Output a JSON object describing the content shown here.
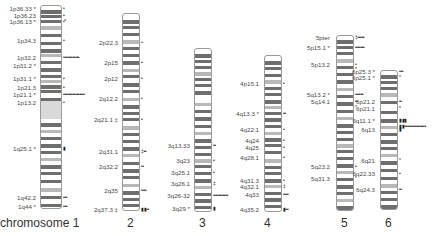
{
  "figure": {
    "type": "chromosome ideogram",
    "chromosomes": [
      {
        "name": "chromosome 1",
        "box": {
          "x": 40,
          "y": 5,
          "w": 22,
          "h": 204
        },
        "bands": [
          4,
          9,
          14,
          20,
          28,
          36,
          43,
          48,
          55,
          62,
          69,
          74,
          79,
          84,
          92,
          98,
          104,
          110,
          117,
          124,
          131,
          138,
          145,
          152,
          159,
          166,
          174,
          182,
          190,
          198
        ],
        "centromere": {
          "y1": 100,
          "y2": 118
        },
        "labels": [
          {
            "text": "1p36.33",
            "y": 8,
            "mark": "*",
            "dots": "•"
          },
          {
            "text": "1p36.23",
            "y": 15,
            "mark": "",
            "dots": "•"
          },
          {
            "text": "1p36.13",
            "y": 21,
            "mark": "*",
            "dots": "•*"
          },
          {
            "text": "1p34.3",
            "y": 40,
            "mark": "",
            "dots": "•"
          },
          {
            "text": "1p32.2",
            "y": 57,
            "mark": "",
            "dots": "••••••••••••"
          },
          {
            "text": "1p31.2",
            "y": 65,
            "mark": "*",
            "dots": ""
          },
          {
            "text": "1p31.1",
            "y": 78,
            "mark": "*",
            "dots": "•"
          },
          {
            "text": "1p21.3",
            "y": 87,
            "mark": "",
            "dots": "•"
          },
          {
            "text": "1p21.1",
            "y": 94,
            "mark": "*",
            "dots": "••••••••••••••••"
          },
          {
            "text": "1p13.2",
            "y": 102,
            "mark": "",
            "dots": "•"
          },
          {
            "text": "1q25.1",
            "y": 148,
            "mark": "*",
            "dots": "▮"
          },
          {
            "text": "1q42.2",
            "y": 197,
            "mark": "",
            "dots": "•••"
          },
          {
            "text": "1q44",
            "y": 206,
            "mark": "*",
            "dots": "•••"
          }
        ],
        "label_x": 36,
        "caption": "chromosome 1",
        "caption_x": 0
      },
      {
        "name": "2",
        "box": {
          "x": 122,
          "y": 13,
          "w": 18,
          "h": 198
        },
        "bands": [
          6,
          12,
          19,
          26,
          33,
          40,
          47,
          55,
          61,
          69,
          76,
          84,
          91,
          98,
          104,
          112,
          119,
          126,
          133,
          140,
          148,
          155,
          162,
          170,
          177,
          184,
          190
        ],
        "labels": [
          {
            "text": "2p22.3",
            "y": 42,
            "mark": "",
            "dots": "•"
          },
          {
            "text": "2p15",
            "y": 62,
            "mark": "",
            "dots": "•"
          },
          {
            "text": "2p12",
            "y": 78,
            "mark": "",
            "dots": "•"
          },
          {
            "text": "2q12.2",
            "y": 98,
            "mark": "",
            "dots": "•"
          },
          {
            "text": "2q21.1",
            "y": 119,
            "mark": "‡",
            "dots": "•"
          },
          {
            "text": "2q31.1",
            "y": 151,
            "mark": "",
            "dots": "‡••"
          },
          {
            "text": "2q32.2",
            "y": 166,
            "mark": "",
            "dots": "••"
          },
          {
            "text": "2q35",
            "y": 190,
            "mark": "",
            "dots": "••••"
          },
          {
            "text": "2q37.3",
            "y": 209,
            "mark": "‡",
            "dots": "▮▮••"
          }
        ],
        "label_x": 118,
        "caption": "2",
        "caption_x": 127
      },
      {
        "name": "3",
        "box": {
          "x": 194,
          "y": 48,
          "w": 18,
          "h": 164
        },
        "bands": [
          5,
          11,
          17,
          23,
          29,
          35,
          42,
          54,
          61,
          68,
          76,
          83,
          90,
          97,
          104,
          110,
          116,
          123,
          130,
          137,
          144,
          150,
          157
        ],
        "labels": [
          {
            "text": "3q13.33",
            "y": 145,
            "mark": "",
            "dots": "••"
          },
          {
            "text": "3q23",
            "y": 160,
            "mark": "",
            "dots": "•"
          },
          {
            "text": "3q25.1",
            "y": 172,
            "mark": "",
            "dots": "•"
          },
          {
            "text": "3q26.1",
            "y": 183,
            "mark": "",
            "dots": "‡"
          },
          {
            "text": "3q26-32",
            "y": 195,
            "mark": "",
            "dots": "•••••••••••"
          },
          {
            "text": "3q29",
            "y": 208,
            "mark": "*",
            "dots": "▮"
          }
        ],
        "label_x": 190,
        "caption": "3",
        "caption_x": 199
      },
      {
        "name": "4",
        "box": {
          "x": 264,
          "y": 55,
          "w": 18,
          "h": 157
        },
        "bands": [
          5,
          11,
          18,
          24,
          31,
          37,
          44,
          50,
          56,
          62,
          69,
          76,
          82,
          88,
          95,
          103,
          110,
          116,
          123,
          129,
          136,
          142,
          149
        ],
        "labels": [
          {
            "text": "4p15.1",
            "y": 83,
            "mark": "",
            "dots": "•"
          },
          {
            "text": "4q13.3",
            "y": 113,
            "mark": "*",
            "dots": "••"
          },
          {
            "text": "4q22.1",
            "y": 129,
            "mark": "",
            "dots": "•"
          },
          {
            "text": "4q24",
            "y": 140,
            "mark": "",
            "dots": "•"
          },
          {
            "text": "4q25",
            "y": 147,
            "mark": "",
            "dots": "•"
          },
          {
            "text": "4q28.1",
            "y": 157,
            "mark": "",
            "dots": "•"
          },
          {
            "text": "4q31.3",
            "y": 180,
            "mark": "",
            "dots": "•"
          },
          {
            "text": "4q32.1",
            "y": 186,
            "mark": "",
            "dots": "‡"
          },
          {
            "text": "4q33",
            "y": 194,
            "mark": "",
            "dots": "••••"
          },
          {
            "text": "4q35.2",
            "y": 209,
            "mark": "",
            "dots": "▮••"
          }
        ],
        "label_x": 259,
        "caption": "4",
        "caption_x": 264
      },
      {
        "name": "5",
        "box": {
          "x": 336,
          "y": 35,
          "w": 18,
          "h": 176
        },
        "bands": [
          4,
          10,
          16,
          23,
          30,
          37,
          44,
          52,
          59,
          66,
          74,
          81,
          88,
          95,
          102,
          108,
          114,
          121,
          128,
          135,
          142,
          149,
          156,
          163,
          170
        ],
        "labels": [
          {
            "text": "5pter",
            "y": 37,
            "mark": "",
            "dots": "‡•••••"
          },
          {
            "text": "5p15.1",
            "y": 47,
            "mark": "*",
            "dots": "•••••••"
          },
          {
            "text": "5p13.2",
            "y": 64,
            "mark": "",
            "dots": "•"
          },
          {
            "text": "",
            "y": 69,
            "mark": "",
            "dots": "*"
          },
          {
            "text": "5q13.2",
            "y": 94,
            "mark": "*",
            "dots": "••••••"
          },
          {
            "text": "5q14.1",
            "y": 101,
            "mark": "",
            "dots": "••"
          },
          {
            "text": "",
            "y": 107,
            "mark": "",
            "dots": "*"
          },
          {
            "text": "5q23.2",
            "y": 166,
            "mark": "",
            "dots": "•"
          },
          {
            "text": "5q31.3",
            "y": 178,
            "mark": "",
            "dots": "*"
          }
        ],
        "label_x": 330,
        "caption": "5",
        "caption_x": 341
      },
      {
        "name": "6",
        "box": {
          "x": 380,
          "y": 70,
          "w": 18,
          "h": 140
        },
        "bands": [
          4,
          10,
          16,
          22,
          30,
          40,
          48,
          55,
          62,
          69,
          76,
          83,
          90,
          98,
          106,
          113,
          120,
          127,
          134
        ],
        "labels": [
          {
            "text": "6p25.3",
            "y": 71,
            "mark": "*",
            "dots": "•••"
          },
          {
            "text": "6p25.1",
            "y": 77,
            "mark": "*",
            "dots": "*"
          },
          {
            "text": "6p21.2",
            "y": 101,
            "mark": "",
            "dots": "••"
          },
          {
            "text": "6p21.1",
            "y": 108,
            "mark": "",
            "dots": "*"
          },
          {
            "text": "6q11.1",
            "y": 120,
            "mark": "*",
            "dots": "▮▮▮"
          },
          {
            "text": "",
            "y": 126,
            "mark": "",
            "dots": "▮▮••••••••••••••••"
          },
          {
            "text": "6q13",
            "y": 129,
            "mark": "",
            "dots": "▮"
          },
          {
            "text": "6q21",
            "y": 160,
            "mark": "",
            "dots": "*"
          },
          {
            "text": "6q22.33",
            "y": 173,
            "mark": "",
            "dots": "•"
          },
          {
            "text": "6q24.3",
            "y": 189,
            "mark": "",
            "dots": "••"
          }
        ],
        "label_x": 375,
        "caption": "6",
        "caption_x": 385
      }
    ]
  },
  "colors": {
    "band_dark": "#6e6e6e",
    "outline": "#9a9a9a",
    "label": "#4a4a4a",
    "marker": "#222222",
    "background": "#ffffff"
  }
}
